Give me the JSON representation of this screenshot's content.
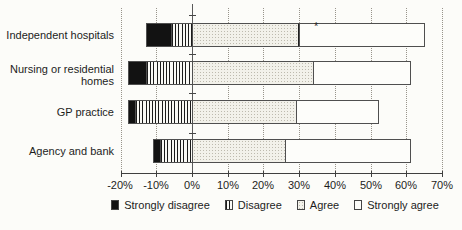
{
  "chart_data": {
    "type": "bar",
    "orientation": "horizontal",
    "stacked": true,
    "diverging": true,
    "title": "",
    "xlabel": "",
    "ylabel": "",
    "categories": [
      "Independent hospitals",
      "Nursing or residential homes",
      "GP practice",
      "Agency and bank"
    ],
    "series": [
      {
        "name": "Strongly disagree",
        "pattern": "solid-black",
        "values": [
          -7,
          -5,
          -2,
          -2
        ]
      },
      {
        "name": "Disagree",
        "pattern": "vertical-stripes",
        "values": [
          -6,
          -13,
          -16,
          -9
        ]
      },
      {
        "name": "Agree",
        "pattern": "light-dotted",
        "values": [
          30,
          34,
          29,
          26
        ]
      },
      {
        "name": "Strongly agree",
        "pattern": "white",
        "values": [
          35,
          27,
          23,
          35
        ]
      }
    ],
    "xlim": [
      -20,
      70
    ],
    "x_ticks": [
      "-20%",
      "-10%",
      "0%",
      "10%",
      "20%",
      "30%",
      "40%",
      "50%",
      "60%",
      "70%"
    ],
    "x_tick_values": [
      -20,
      -10,
      0,
      10,
      20,
      30,
      40,
      50,
      60,
      70
    ],
    "grid": "dotted-vertical",
    "legend_position": "bottom",
    "annotation": {
      "text": "*",
      "category_index": 0,
      "value_x": 35
    },
    "strong_divider": {
      "category_index": 0,
      "after_series": "Agree"
    },
    "colors": {
      "background": "#fcfcf9",
      "bar_outline": "#4f4f4f",
      "strongly_disagree_fill": "#121212",
      "agree_fill": "#f2f1ea",
      "strongly_agree_fill": "#fdfdfa",
      "grid": "#98948b",
      "text": "#1c1c1c"
    }
  }
}
